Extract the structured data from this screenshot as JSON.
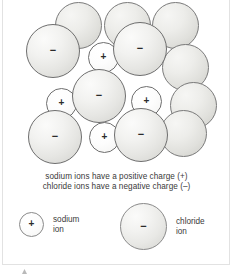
{
  "figure": {
    "background_color": "#ffffff",
    "frame_color": "#e2e2e2"
  },
  "charge_symbols": {
    "positive": "+",
    "negative": "−"
  },
  "colors": {
    "chloride_fill": "#e6e6e3",
    "sodium_fill": "#fdfdfd",
    "outline": "#6e6e6e",
    "text": "#3a3a3a"
  },
  "lattice": {
    "description": "Close-packed arrangement of large chloride ions and small sodium ions",
    "back_spheres": [
      {
        "name": "chloride-back-1",
        "x": 55,
        "y": 2,
        "d": 47
      },
      {
        "name": "chloride-back-2",
        "x": 104,
        "y": 2,
        "d": 47
      },
      {
        "name": "chloride-back-3",
        "x": 152,
        "y": 2,
        "d": 47
      },
      {
        "name": "chloride-back-4",
        "x": 162,
        "y": 44,
        "d": 47
      },
      {
        "name": "chloride-back-5",
        "x": 170,
        "y": 82,
        "d": 47
      },
      {
        "name": "chloride-back-6",
        "x": 160,
        "y": 110,
        "d": 47
      }
    ],
    "front_spheres": [
      {
        "name": "chloride-ion",
        "ion": "chloride",
        "charge": "−",
        "x": 26,
        "y": 24,
        "d": 54
      },
      {
        "name": "sodium-ion",
        "ion": "sodium",
        "charge": "+",
        "x": 88,
        "y": 42,
        "d": 31
      },
      {
        "name": "chloride-ion",
        "ion": "chloride",
        "charge": "−",
        "x": 113,
        "y": 22,
        "d": 54
      },
      {
        "name": "sodium-ion",
        "ion": "sodium",
        "charge": "+",
        "x": 46,
        "y": 88,
        "d": 31
      },
      {
        "name": "chloride-ion",
        "ion": "chloride",
        "charge": "−",
        "x": 72,
        "y": 69,
        "d": 54
      },
      {
        "name": "sodium-ion",
        "ion": "sodium",
        "charge": "+",
        "x": 131,
        "y": 86,
        "d": 31
      },
      {
        "name": "chloride-ion",
        "ion": "chloride",
        "charge": "−",
        "x": 28,
        "y": 110,
        "d": 54
      },
      {
        "name": "sodium-ion",
        "ion": "sodium",
        "charge": "+",
        "x": 89,
        "y": 122,
        "d": 31
      },
      {
        "name": "chloride-ion",
        "ion": "chloride",
        "charge": "−",
        "x": 114,
        "y": 108,
        "d": 54
      }
    ]
  },
  "captions": [
    "sodium ions have a positive charge (+)",
    "chloride ions have a negative charge (–)"
  ],
  "legend": {
    "sodium": {
      "charge": "+",
      "label_line1": "sodium",
      "label_line2": "ion"
    },
    "chloride": {
      "charge": "−",
      "label_line1": "chloride",
      "label_line2": "ion"
    }
  }
}
